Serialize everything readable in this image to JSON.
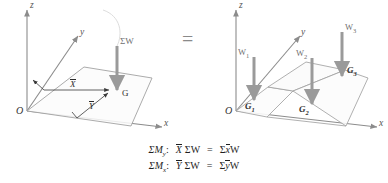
{
  "figure": {
    "equals_symbol": "=",
    "left_diagram": {
      "name": "resultant-weight-diagram",
      "axes": {
        "z": "z",
        "y": "y",
        "x": "x"
      },
      "origin_label": "O",
      "force": {
        "label": "ΣW",
        "direction": "down"
      },
      "centroid_label": "G",
      "dimensions": {
        "x_bar": "X",
        "y_bar": "Y"
      }
    },
    "right_diagram": {
      "name": "component-weights-diagram",
      "axes": {
        "z": "z",
        "y": "y",
        "x": "x"
      },
      "origin_label": "O",
      "forces": [
        {
          "label": "W",
          "sub": "1",
          "point": "G",
          "point_sub": "1"
        },
        {
          "label": "W",
          "sub": "2",
          "point": "G",
          "point_sub": "2"
        },
        {
          "label": "W",
          "sub": "3",
          "point": "G",
          "point_sub": "3"
        }
      ]
    },
    "equations": [
      {
        "moment_symbol": "ΣM",
        "moment_sub": "y",
        "colon": ":",
        "lhs_bar": "X",
        "lhs_sum": "ΣW",
        "equals": "=",
        "rhs_sum": "Σ",
        "rhs_bar": "x",
        "rhs_w": "W"
      },
      {
        "moment_symbol": "ΣM",
        "moment_sub": "x",
        "colon": ":",
        "lhs_bar": "Y",
        "lhs_sum": "ΣW",
        "equals": "=",
        "rhs_sum": "Σ",
        "rhs_bar": "y",
        "rhs_w": "W"
      }
    ]
  },
  "colors": {
    "axis": "#8c8c8c",
    "plate": "#9a9a9a",
    "arrow": "#9a9a9a",
    "text": "#2b2b2b"
  }
}
